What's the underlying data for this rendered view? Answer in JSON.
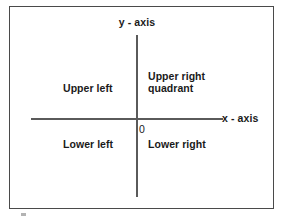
{
  "diagram": {
    "type": "cartesian-coordinate-quadrants",
    "axes": {
      "y_axis_label": "y - axis",
      "x_axis_label": "x - axis",
      "origin_label": "0"
    },
    "quadrants": {
      "upper_left": "Upper left",
      "upper_right": "Upper right\nquadrant",
      "lower_left": "Lower left",
      "lower_right": "Lower right"
    },
    "colors": {
      "frame": "#4a4a4a",
      "axis": "#5a5a5a",
      "text": "#1a1a1a",
      "background": "#ffffff"
    }
  }
}
